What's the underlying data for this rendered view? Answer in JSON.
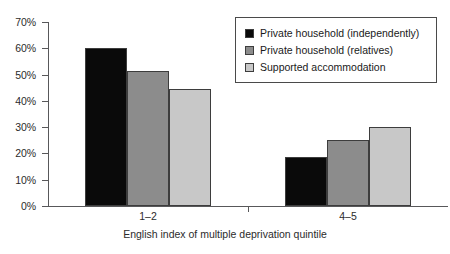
{
  "chart_data": {
    "type": "bar",
    "title": "",
    "subtitle": "",
    "xlabel": "English index of multiple deprivation quintile",
    "ylabel": "",
    "categories": [
      "1–2",
      "4–5"
    ],
    "series": [
      {
        "name": "Private household (independently)",
        "values": [
          60.0,
          18.5
        ],
        "color": "#0a0a0a"
      },
      {
        "name": "Private household (relatives)",
        "values": [
          51.5,
          25.0
        ],
        "color": "#8c8c8c"
      },
      {
        "name": "Supported accommodation",
        "values": [
          44.5,
          30.0
        ],
        "color": "#c8c8c8"
      }
    ],
    "ylim": [
      0,
      70
    ],
    "yticks": [
      0,
      10,
      20,
      30,
      40,
      50,
      60,
      70
    ],
    "ytick_labels": [
      "0%",
      "10%",
      "20%",
      "30%",
      "40%",
      "50%",
      "60%",
      "70%"
    ],
    "grid": false,
    "legend_position": "top-right",
    "value_suffix": "%"
  },
  "legend": {
    "entries": [
      {
        "label": "Private household (independently)",
        "swatch": "black-swatch-icon"
      },
      {
        "label": "Private household (relatives)",
        "swatch": "gray-swatch-icon"
      },
      {
        "label": "Supported accommodation",
        "swatch": "light-gray-swatch-icon"
      }
    ]
  },
  "axes": {
    "x_title": "English index of multiple deprivation quintile",
    "x_labels": [
      "1–2",
      "4–5"
    ],
    "y_labels": [
      "70%",
      "60%",
      "50%",
      "40%",
      "30%",
      "20%",
      "10%",
      "0%"
    ]
  },
  "colors": {
    "series_1": "#0a0a0a",
    "series_2": "#8c8c8c",
    "series_3": "#c8c8c8",
    "axis": "#58585a",
    "bar_border": "#3d3d3d",
    "background": "#ffffff",
    "text": "#1a1a1a"
  }
}
